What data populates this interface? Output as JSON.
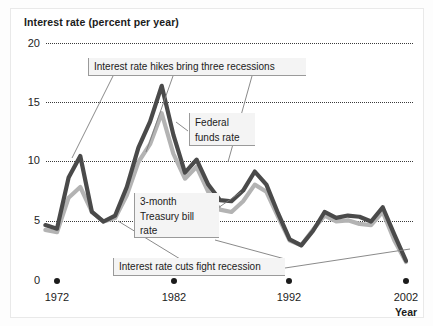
{
  "chart_data": {
    "type": "line",
    "title": "Interest rate (percent per year)",
    "xlabel": "Year",
    "ylabel": "Interest rate (percent per year)",
    "xlim": [
      1971,
      2002
    ],
    "ylim": [
      0,
      20
    ],
    "grid": true,
    "legend": "annotated-inline",
    "yticks": [
      "0",
      "5",
      "10",
      "15",
      "20"
    ],
    "ytick_values": [
      0,
      5,
      10,
      15,
      20
    ],
    "xticks": [
      "1972",
      "1982",
      "1992",
      "2002"
    ],
    "xtick_values": [
      1972,
      1982,
      1992,
      2002
    ],
    "x": [
      1971,
      1972,
      1973,
      1974,
      1975,
      1976,
      1977,
      1978,
      1979,
      1980,
      1981,
      1982,
      1983,
      1984,
      1985,
      1986,
      1987,
      1988,
      1989,
      1990,
      1991,
      1992,
      1993,
      1994,
      1995,
      1996,
      1997,
      1998,
      1999,
      2000,
      2001,
      2002
    ],
    "series": [
      {
        "name": "Federal funds rate",
        "color": "#4a4a4a",
        "values": [
          4.7,
          4.4,
          8.7,
          10.5,
          5.8,
          5.0,
          5.5,
          7.9,
          11.2,
          13.4,
          16.4,
          12.3,
          9.1,
          10.2,
          8.1,
          6.8,
          6.7,
          7.6,
          9.2,
          8.1,
          5.7,
          3.5,
          3.0,
          4.2,
          5.8,
          5.3,
          5.5,
          5.4,
          5.0,
          6.2,
          3.9,
          1.7
        ]
      },
      {
        "name": "3-month Treasury bill rate",
        "color": "#b3b3b3",
        "values": [
          4.3,
          4.1,
          7.0,
          7.9,
          5.8,
          5.0,
          5.3,
          7.2,
          10.0,
          11.5,
          14.1,
          10.7,
          8.6,
          9.6,
          7.5,
          6.0,
          5.8,
          6.7,
          8.1,
          7.5,
          5.4,
          3.4,
          3.0,
          4.3,
          5.5,
          5.0,
          5.1,
          4.8,
          4.7,
          5.8,
          3.4,
          1.6
        ]
      }
    ],
    "annotations": [
      {
        "id": "hikes",
        "text": "Interest rate hikes bring three recessions"
      },
      {
        "id": "federal-funds",
        "text": "Federal\nfunds rate",
        "line1": "Federal",
        "line2": "funds rate"
      },
      {
        "id": "treasury-bill",
        "text": "3-month Treasury bill rate",
        "line1": "3-month",
        "line2": "Treasury bill",
        "line3": "rate"
      },
      {
        "id": "cuts",
        "text": "Interest rate cuts fight recession"
      }
    ]
  },
  "colors": {
    "federal_funds": "#4a4a4a",
    "treasury_bill": "#b3b3b3",
    "gridline": "#3a3a3a",
    "text": "#1b1b1b",
    "callout_bg": "#f4f4f4",
    "callout_border": "#9a9a9a",
    "frame": "#e9e9e9",
    "background": "#ffffff"
  }
}
